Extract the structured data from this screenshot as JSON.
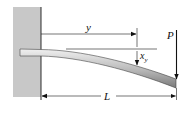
{
  "diagram": {
    "labels": {
      "distance": "y",
      "deflection": "x",
      "deflection_sub": "y",
      "load": "P",
      "length": "L"
    },
    "colors": {
      "wall": "#c8c8c8",
      "beam_top": "#e6e6e6",
      "beam_bottom": "#8a8a8a",
      "line": "#1a1a1a"
    }
  }
}
